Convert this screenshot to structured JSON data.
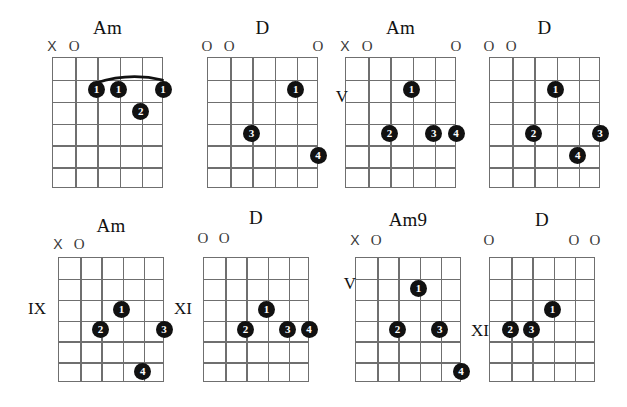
{
  "page": {
    "width": 627,
    "height": 407,
    "background": "#ffffff",
    "ink_color": "#111111",
    "grid_color": "#6f6f6f"
  },
  "legend": {
    "open_symbol": "O",
    "muted_symbol": "X",
    "finger_labels": [
      "1",
      "2",
      "3",
      "4"
    ]
  },
  "diagrams": [
    {
      "id": "chord-1",
      "name": "Am",
      "position_label": "",
      "position_side": "",
      "strings": 6,
      "frets": 6,
      "open_muted": [
        {
          "string": 1,
          "symbol": "X"
        },
        {
          "string": 2,
          "symbol": "O"
        }
      ],
      "barre": {
        "from_string": 3,
        "to_string": 6,
        "fret": 2
      },
      "dots": [
        {
          "string": 3,
          "fret": 2,
          "finger": "1"
        },
        {
          "string": 4,
          "fret": 2,
          "finger": "1"
        },
        {
          "string": 6,
          "fret": 2,
          "finger": "1"
        },
        {
          "string": 5,
          "fret": 3,
          "finger": "2"
        }
      ]
    },
    {
      "id": "chord-2",
      "name": "D",
      "position_label": "",
      "position_side": "",
      "strings": 6,
      "frets": 6,
      "open_muted": [
        {
          "string": 1,
          "symbol": "O"
        },
        {
          "string": 2,
          "symbol": "O"
        },
        {
          "string": 6,
          "symbol": "O"
        }
      ],
      "barre": null,
      "dots": [
        {
          "string": 5,
          "fret": 2,
          "finger": "1"
        },
        {
          "string": 3,
          "fret": 4,
          "finger": "3"
        },
        {
          "string": 6,
          "fret": 5,
          "finger": "4"
        }
      ]
    },
    {
      "id": "chord-3",
      "name": "Am",
      "position_label": "V",
      "position_side": "left",
      "strings": 6,
      "frets": 6,
      "open_muted": [
        {
          "string": 1,
          "symbol": "X"
        },
        {
          "string": 2,
          "symbol": "O"
        },
        {
          "string": 6,
          "symbol": "O"
        }
      ],
      "barre": null,
      "dots": [
        {
          "string": 4,
          "fret": 2,
          "finger": "1"
        },
        {
          "string": 3,
          "fret": 4,
          "finger": "2"
        },
        {
          "string": 5,
          "fret": 4,
          "finger": "3"
        },
        {
          "string": 6,
          "fret": 4,
          "finger": "4"
        }
      ]
    },
    {
      "id": "chord-4",
      "name": "D",
      "position_label": "",
      "position_side": "",
      "strings": 6,
      "frets": 6,
      "open_muted": [
        {
          "string": 1,
          "symbol": "O"
        },
        {
          "string": 2,
          "symbol": "O"
        }
      ],
      "barre": null,
      "dots": [
        {
          "string": 4,
          "fret": 2,
          "finger": "1"
        },
        {
          "string": 3,
          "fret": 4,
          "finger": "2"
        },
        {
          "string": 6,
          "fret": 4,
          "finger": "3"
        },
        {
          "string": 5,
          "fret": 5,
          "finger": "4"
        }
      ]
    },
    {
      "id": "chord-5",
      "name": "Am",
      "position_label": "IX",
      "position_side": "left",
      "strings": 6,
      "frets": 6,
      "open_muted": [
        {
          "string": 1,
          "symbol": "X"
        },
        {
          "string": 2,
          "symbol": "O"
        }
      ],
      "barre": null,
      "dots": [
        {
          "string": 4,
          "fret": 3,
          "finger": "1"
        },
        {
          "string": 3,
          "fret": 4,
          "finger": "2"
        },
        {
          "string": 6,
          "fret": 4,
          "finger": "3"
        },
        {
          "string": 5,
          "fret": 6,
          "finger": "4"
        }
      ]
    },
    {
      "id": "chord-6",
      "name": "D",
      "position_label": "XI",
      "position_side": "left",
      "strings": 6,
      "frets": 6,
      "open_muted": [
        {
          "string": 1,
          "symbol": "O"
        },
        {
          "string": 2,
          "symbol": "O"
        }
      ],
      "barre": null,
      "dots": [
        {
          "string": 4,
          "fret": 3,
          "finger": "1"
        },
        {
          "string": 3,
          "fret": 4,
          "finger": "2"
        },
        {
          "string": 5,
          "fret": 4,
          "finger": "3"
        },
        {
          "string": 6,
          "fret": 4,
          "finger": "4"
        }
      ]
    },
    {
      "id": "chord-7",
      "name": "Am9",
      "position_label": "V",
      "position_side": "left",
      "strings": 6,
      "frets": 6,
      "open_muted": [
        {
          "string": 1,
          "symbol": "X"
        },
        {
          "string": 2,
          "symbol": "O"
        }
      ],
      "barre": null,
      "dots": [
        {
          "string": 4,
          "fret": 2,
          "finger": "1"
        },
        {
          "string": 3,
          "fret": 4,
          "finger": "2"
        },
        {
          "string": 5,
          "fret": 4,
          "finger": "3"
        },
        {
          "string": 6,
          "fret": 6,
          "finger": "4"
        }
      ]
    },
    {
      "id": "chord-8",
      "name": "D",
      "position_label": "XI",
      "position_side": "left",
      "strings": 6,
      "frets": 6,
      "open_muted": [
        {
          "string": 1,
          "symbol": "O"
        },
        {
          "string": 5,
          "symbol": "O"
        },
        {
          "string": 6,
          "symbol": "O"
        }
      ],
      "barre": null,
      "dots": [
        {
          "string": 4,
          "fret": 3,
          "finger": "1"
        },
        {
          "string": 2,
          "fret": 4,
          "finger": "2"
        },
        {
          "string": 3,
          "fret": 4,
          "finger": "3"
        }
      ]
    }
  ],
  "layout": {
    "boxes": [
      {
        "left": 52,
        "top": 57,
        "width": 111,
        "height": 131
      },
      {
        "left": 207,
        "top": 57,
        "width": 111,
        "height": 131
      },
      {
        "left": 345,
        "top": 57,
        "width": 111,
        "height": 131
      },
      {
        "left": 489,
        "top": 57,
        "width": 111,
        "height": 131
      },
      {
        "left": 58,
        "top": 257,
        "width": 106,
        "height": 125
      },
      {
        "left": 203,
        "top": 257,
        "width": 106,
        "height": 125
      },
      {
        "left": 355,
        "top": 257,
        "width": 106,
        "height": 125
      },
      {
        "left": 489,
        "top": 257,
        "width": 106,
        "height": 125
      }
    ],
    "name_tops": [
      18,
      18,
      18,
      18,
      216,
      208,
      210,
      210
    ],
    "marker_tops": [
      40,
      40,
      40,
      40,
      238,
      232,
      234,
      234
    ],
    "position_tops": [
      0,
      0,
      88,
      0,
      300,
      300,
      275,
      322
    ],
    "position_lefts": [
      0,
      0,
      322,
      0,
      20,
      166,
      330,
      463
    ]
  }
}
